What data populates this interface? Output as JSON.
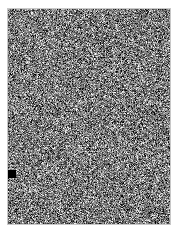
{
  "image": {
    "kind": "grayscale-noise-texture",
    "canvas_width": 180,
    "canvas_height": 234,
    "background_color": "#ffffff"
  },
  "noise_field": {
    "name": "random-grayscale-noise-region",
    "x": 8,
    "y": 9,
    "width": 162,
    "height": 215,
    "mean_gray": 122,
    "contrast_spread": 58,
    "min_gray": 0,
    "max_gray": 255,
    "grain_size_px": 1,
    "seed": 20240517,
    "border_color": "#c8c8c8"
  },
  "marker": {
    "name": "black-square-marker",
    "x": 8,
    "y": 170,
    "width": 8,
    "height": 8,
    "color": "#000000"
  },
  "annotations": {
    "title": "",
    "labels": [],
    "axes": [],
    "legend": []
  }
}
